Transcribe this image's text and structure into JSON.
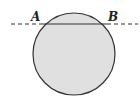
{
  "diagram": {
    "type": "geometry",
    "labels": {
      "a": "A",
      "b": "B"
    },
    "circle": {
      "cx": 74,
      "cy": 54,
      "r": 41,
      "fill": "#e0e0e0",
      "stroke": "#333333"
    },
    "chord_y": 24,
    "colors": {
      "line": "#333333",
      "fill": "#e0e0e0"
    }
  }
}
